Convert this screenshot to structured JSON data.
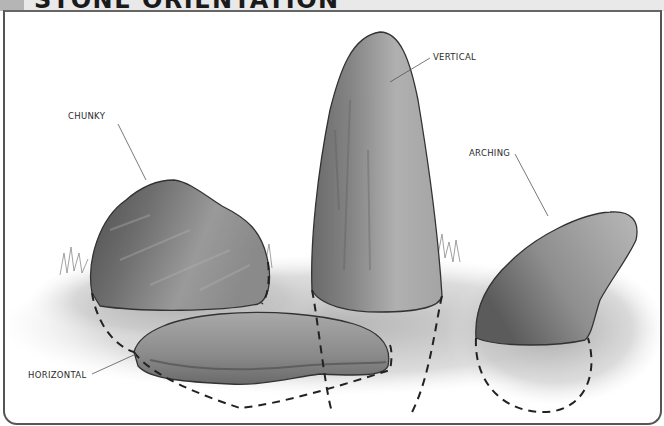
{
  "header": {
    "title": "STONE ORIENTATION"
  },
  "illustration": {
    "style": "pencil-and-wash greyscale sketch",
    "labels": {
      "chunky": "CHUNKY",
      "vertical": "VERTICAL",
      "arching": "ARCHING",
      "horizontal": "HORIZONTAL"
    },
    "colors": {
      "stone_dark": "#5a5a5a",
      "stone_mid": "#8c8c8c",
      "stone_light": "#b9b9b9",
      "grass": "#a8a8a8",
      "frame": "#555555",
      "header_bg": "#e9e9e9",
      "header_block": "#b5b5b5"
    }
  }
}
